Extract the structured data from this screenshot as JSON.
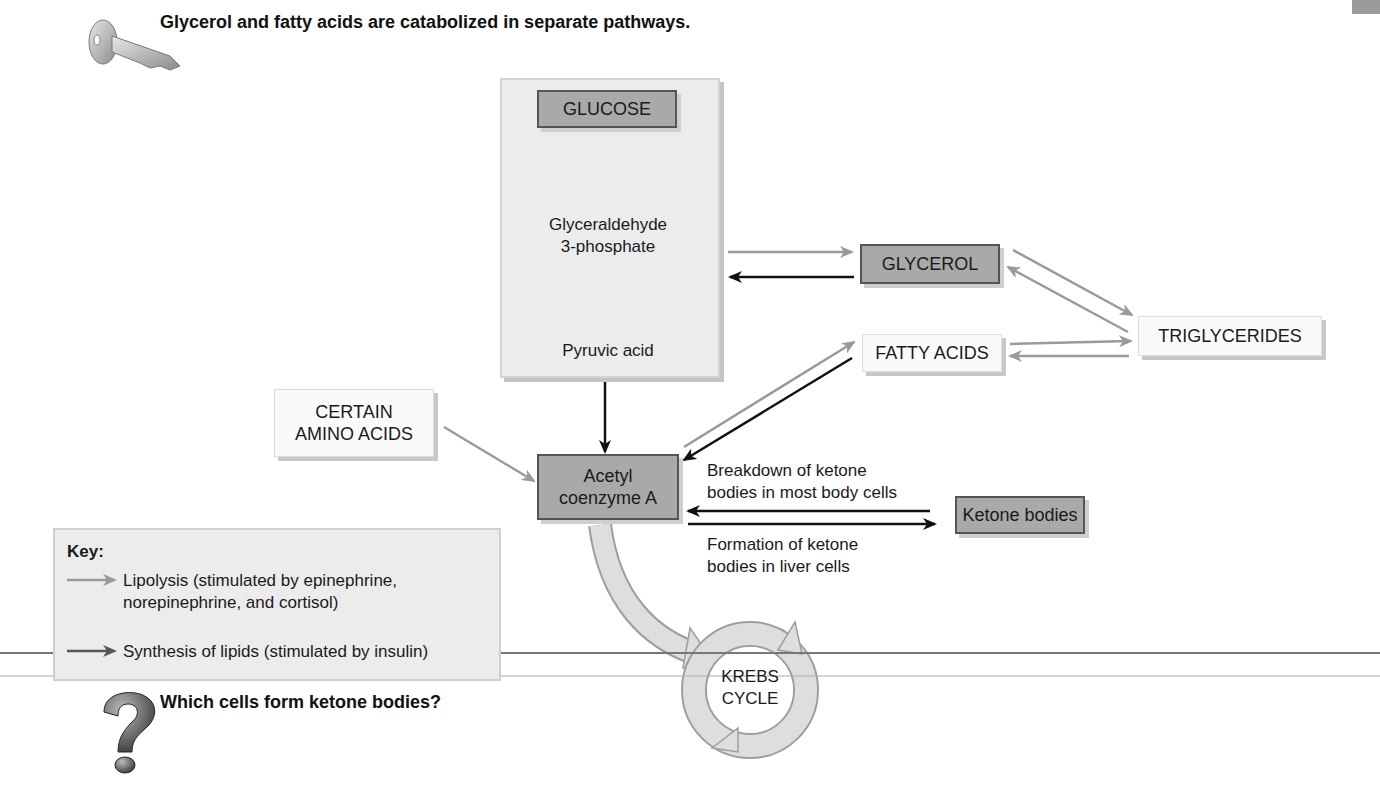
{
  "header": {
    "title": "Glycerol and fatty acids are catabolized in separate pathways.",
    "icon": "key-icon"
  },
  "diagram": {
    "glucose_panel": {
      "glucose": "GLUCOSE",
      "g3p_line1": "Glyceraldehyde",
      "g3p_line2": "3-phosphate",
      "pyruvic": "Pyruvic acid"
    },
    "glycerol": "GLYCEROL",
    "fatty_acids": "FATTY ACIDS",
    "triglycerides": "TRIGLYCERIDES",
    "amino_acids_line1": "CERTAIN",
    "amino_acids_line2": "AMINO ACIDS",
    "acetyl_line1": "Acetyl",
    "acetyl_line2": "coenzyme A",
    "ketone_bodies": "Ketone bodies",
    "breakdown_line1": "Breakdown of ketone",
    "breakdown_line2": "bodies in most body cells",
    "formation_line1": "Formation of ketone",
    "formation_line2": "bodies in liver cells",
    "krebs_line1": "KREBS",
    "krebs_line2": "CYCLE"
  },
  "key": {
    "title": "Key:",
    "items": [
      {
        "line1": "Lipolysis (stimulated by epinephrine,",
        "line2": "norepinephrine, and cortisol)",
        "arrow_color": "#9a9a9a"
      },
      {
        "line1": "Synthesis of lipids (stimulated by insulin)",
        "arrow_color": "#555555"
      }
    ]
  },
  "footer": {
    "question": "Which cells form ketone bodies?",
    "icon": "question-mark-icon"
  },
  "colors": {
    "lipolysis_arrow": "#9a9a9a",
    "synthesis_arrow": "#111111",
    "dark_box": "#a9a9a9",
    "panel": "#ececec"
  }
}
